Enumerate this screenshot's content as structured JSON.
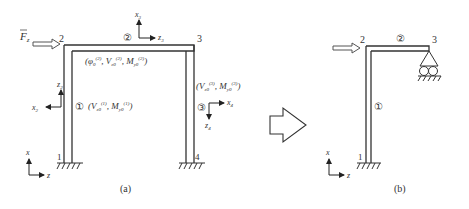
{
  "figure_a": {
    "caption": "(a)",
    "nodes": {
      "n1": "1",
      "n2": "2",
      "n3": "3",
      "n4": "4"
    },
    "members": {
      "m1": "①",
      "m2": "②",
      "m3": "③"
    },
    "load": {
      "symbol": "F",
      "subscript": "z"
    },
    "member_labels": {
      "m1": {
        "open": "(",
        "V": "V",
        "V_sub": "z0",
        "V_sup": "(1)",
        "sep": ", ",
        "M": "M",
        "M_sub": "y0",
        "M_sup": "(1)",
        "close": ")"
      },
      "m2": {
        "open": "(",
        "phi": "φ",
        "phi_sub": "0",
        "phi_sup": "(2)",
        "sep": ", ",
        "V": "V",
        "V_sub": "z0",
        "V_sup": "(2)",
        "M": "M",
        "M_sub": "y0",
        "M_sup": "(2)",
        "close": ")"
      },
      "m3": {
        "open": "(",
        "V": "V",
        "V_sub": "z0",
        "V_sup": "(3)",
        "sep": ", ",
        "M": "M",
        "M_sub": "y0",
        "M_sup": "(3)",
        "close": ")"
      }
    },
    "local_axes": {
      "x2": "x",
      "x2_sub": "2",
      "z2": "z",
      "z2_sub": "2",
      "x3": "x",
      "x3_sub": "3",
      "z3": "z",
      "z3_sub": "3",
      "x4": "x",
      "x4_sub": "4",
      "z4": "z",
      "z4_sub": "4"
    },
    "global_axes": {
      "x": "x",
      "z": "z"
    }
  },
  "figure_b": {
    "caption": "(b)",
    "nodes": {
      "n1": "1",
      "n2": "2",
      "n3": "3"
    },
    "members": {
      "m1": "①",
      "m2": "②"
    },
    "global_axes": {
      "x": "x",
      "z": "z"
    }
  },
  "transform_arrow": "hollow-right-arrow"
}
